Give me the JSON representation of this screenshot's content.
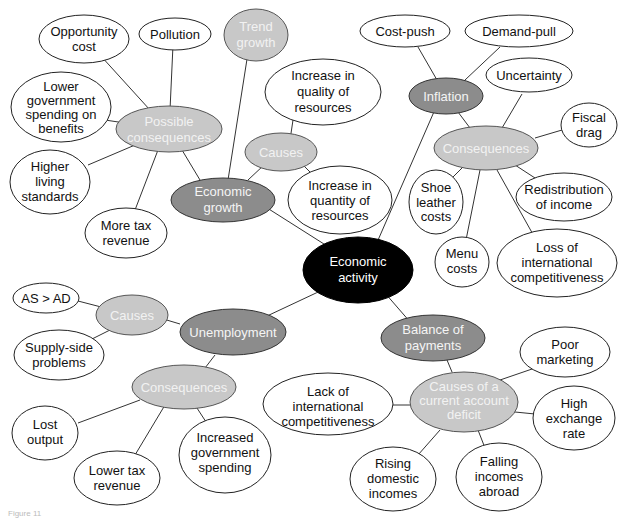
{
  "diagram": {
    "root": {
      "label": [
        "Economic",
        "activity"
      ]
    },
    "branches": {
      "economic_growth": {
        "label": [
          "Economic",
          "growth"
        ]
      },
      "trend_growth": {
        "label": [
          "Trend",
          "growth"
        ]
      },
      "eg_causes": {
        "label": [
          "Causes"
        ]
      },
      "eg_cause_quality": {
        "label": [
          "Increase in",
          "quality of",
          "resources"
        ]
      },
      "eg_cause_quantity": {
        "label": [
          "Increase in",
          "quantity of",
          "resources"
        ]
      },
      "eg_consequences": {
        "label": [
          "Possible",
          "consequences"
        ]
      },
      "eg_con_opportunity": {
        "label": [
          "Opportunity",
          "cost"
        ]
      },
      "eg_con_pollution": {
        "label": [
          "Pollution"
        ]
      },
      "eg_con_lower_gov": {
        "label": [
          "Lower",
          "government",
          "spending on",
          "benefits"
        ]
      },
      "eg_con_living": {
        "label": [
          "Higher",
          "living",
          "standards"
        ]
      },
      "eg_con_tax": {
        "label": [
          "More tax",
          "revenue"
        ]
      },
      "inflation": {
        "label": [
          "Inflation"
        ]
      },
      "inf_cost_push": {
        "label": [
          "Cost-push"
        ]
      },
      "inf_demand_pull": {
        "label": [
          "Demand-pull"
        ]
      },
      "inf_consequences": {
        "label": [
          "Consequences"
        ]
      },
      "inf_con_uncertainty": {
        "label": [
          "Uncertainty"
        ]
      },
      "inf_con_fiscal": {
        "label": [
          "Fiscal",
          "drag"
        ]
      },
      "inf_con_redistribution": {
        "label": [
          "Redistribution",
          "of income"
        ]
      },
      "inf_con_shoe": {
        "label": [
          "Shoe",
          "leather",
          "costs"
        ]
      },
      "inf_con_menu": {
        "label": [
          "Menu",
          "costs"
        ]
      },
      "inf_con_loss": {
        "label": [
          "Loss of",
          "international",
          "competitiveness"
        ]
      },
      "unemployment": {
        "label": [
          "Unemployment"
        ]
      },
      "un_causes": {
        "label": [
          "Causes"
        ]
      },
      "un_cause_asad": {
        "label": [
          "AS > AD"
        ]
      },
      "un_cause_supply": {
        "label": [
          "Supply-side",
          "problems"
        ]
      },
      "un_consequences": {
        "label": [
          "Consequences"
        ]
      },
      "un_con_lost": {
        "label": [
          "Lost",
          "output"
        ]
      },
      "un_con_lower_tax": {
        "label": [
          "Lower tax",
          "revenue"
        ]
      },
      "un_con_gov": {
        "label": [
          "Increased",
          "government",
          "spending"
        ]
      },
      "bop": {
        "label": [
          "Balance of",
          "payments"
        ]
      },
      "bop_causes": {
        "label": [
          "Causes of a",
          "current account",
          "deficit"
        ]
      },
      "bop_lack": {
        "label": [
          "Lack of",
          "international",
          "competitiveness"
        ]
      },
      "bop_poor": {
        "label": [
          "Poor",
          "marketing"
        ]
      },
      "bop_high": {
        "label": [
          "High",
          "exchange",
          "rate"
        ]
      },
      "bop_falling": {
        "label": [
          "Falling",
          "incomes",
          "abroad"
        ]
      },
      "bop_rising": {
        "label": [
          "Rising",
          "domestic",
          "incomes"
        ]
      }
    },
    "caption": "Figure 11"
  }
}
